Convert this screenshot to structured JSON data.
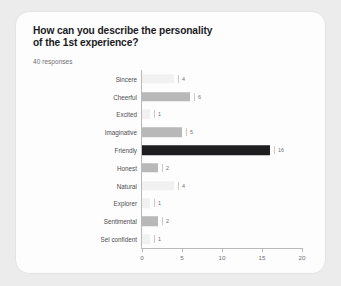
{
  "card": {
    "title": "How can you describe the personality\nof the 1st experience?",
    "subtitle": "40 responses"
  },
  "colors": {
    "page_background": "#ececec",
    "card_background": "#fdfdfd",
    "card_border": "#e3e3e3",
    "title_text": "#1b1b1d",
    "subtitle_text": "#6d6d70",
    "axis": "#b9b9b9",
    "bar_light": "#f1f1f1",
    "bar_medium": "#b8b8b8",
    "bar_dark": "#1e1e20"
  },
  "chart_data": {
    "type": "bar",
    "orientation": "horizontal",
    "title": "How can you describe the personality of the 1st experience?",
    "subtitle": "40 responses",
    "xlabel": "",
    "ylabel": "",
    "xlim": [
      0,
      20
    ],
    "grid": false,
    "legend": "none",
    "xticks": [
      "0",
      "5",
      "10",
      "15",
      "20"
    ],
    "xtick_values": [
      0,
      5,
      10,
      15,
      20
    ],
    "categories": [
      "Sincere",
      "Cheerful",
      "Excited",
      "Imaginative",
      "Friendly",
      "Honest",
      "Natural",
      "Explorer",
      "Sentimental",
      "Sel confident"
    ],
    "values": [
      4,
      6,
      1,
      5,
      16,
      2,
      4,
      1,
      2,
      1
    ],
    "value_labels": [
      "4",
      "6",
      "1",
      "5",
      "16",
      "2",
      "4",
      "1",
      "2",
      "1"
    ],
    "bar_colors": [
      "#f1f1f1",
      "#b8b8b8",
      "#f1f1f1",
      "#b8b8b8",
      "#1e1e20",
      "#b8b8b8",
      "#f1f1f1",
      "#f1f1f1",
      "#b8b8b8",
      "#f1f1f1"
    ]
  }
}
